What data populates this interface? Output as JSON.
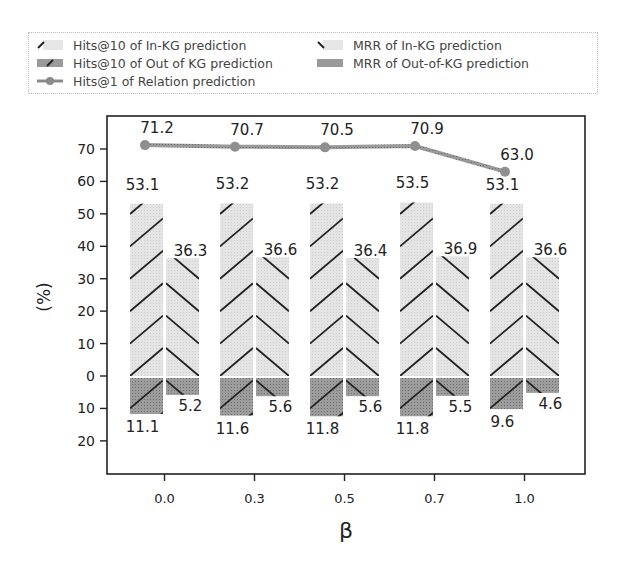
{
  "chart_data": {
    "type": "bar",
    "title": "",
    "xlabel": "β",
    "ylabel": "(%)",
    "categories": [
      "0.0",
      "0.3",
      "0.5",
      "0.7",
      "1.0"
    ],
    "y_ticks": [
      "70",
      "60",
      "50",
      "40",
      "30",
      "20",
      "10",
      "0",
      "10",
      "20"
    ],
    "y_tick_values": [
      70,
      60,
      50,
      40,
      30,
      20,
      10,
      0,
      -10,
      -20
    ],
    "ylim": [
      -30,
      77
    ],
    "grid": false,
    "legend_position": "top",
    "series": [
      {
        "name": "Hits@10 of In-KG prediction",
        "type": "bar",
        "direction": "up",
        "values": [
          53.1,
          53.2,
          53.2,
          53.5,
          53.1
        ]
      },
      {
        "name": "MRR of In-KG prediction",
        "type": "bar",
        "direction": "up",
        "values": [
          36.3,
          36.6,
          36.4,
          36.9,
          36.6
        ]
      },
      {
        "name": "Hits@10 of Out of KG prediction",
        "type": "bar",
        "direction": "down",
        "values": [
          11.1,
          11.6,
          11.8,
          11.8,
          9.6
        ]
      },
      {
        "name": "MRR of Out-of-KG prediction",
        "type": "bar",
        "direction": "down",
        "values": [
          5.2,
          5.6,
          5.6,
          5.5,
          4.6
        ]
      },
      {
        "name": "Hits@1 of Relation prediction",
        "type": "line",
        "values": [
          71.2,
          70.7,
          70.5,
          70.9,
          63.0
        ]
      }
    ]
  },
  "legend": {
    "items": [
      {
        "label": "Hits@10 of In-KG prediction",
        "icon": "hatch-forward-light"
      },
      {
        "label": "MRR of In-KG prediction",
        "icon": "hatch-backward-light"
      },
      {
        "label": "Hits@10 of Out of KG prediction",
        "icon": "hatch-forward-dark"
      },
      {
        "label": "MRR of Out-of-KG prediction",
        "icon": "hatch-backward-dark"
      },
      {
        "label": "Hits@1 of Relation prediction",
        "icon": "line-diamond-marker"
      }
    ]
  },
  "colors": {
    "in_kg_fill": "#dcdcdc",
    "out_kg_fill": "#8f8f8f",
    "line": "#8a8a8a",
    "hatch": "#222222",
    "axis": "#222222"
  }
}
